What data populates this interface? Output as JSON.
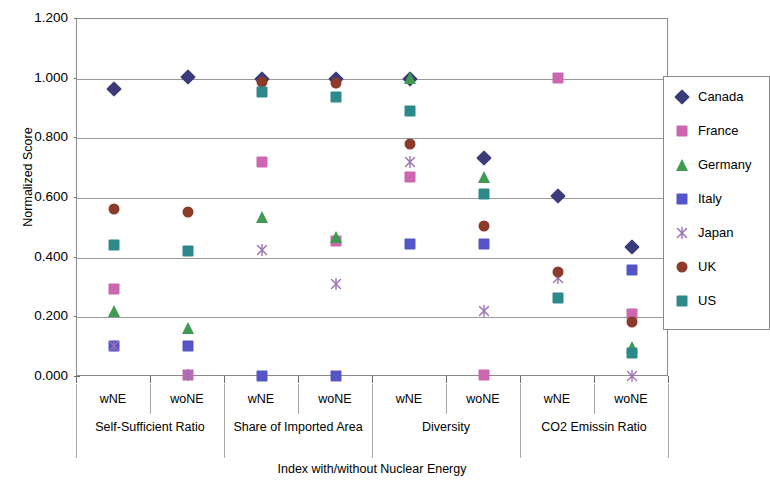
{
  "chart_data": {
    "type": "scatter",
    "title": "",
    "xlabel": "Index with/without Nuclear Energy",
    "ylabel": "Normalized Score",
    "ylim": [
      0.0,
      1.2
    ],
    "yticks": [
      "0.000",
      "0.200",
      "0.400",
      "0.600",
      "0.800",
      "1.000",
      "1.200"
    ],
    "ytick_values": [
      0.0,
      0.2,
      0.4,
      0.6,
      0.8,
      1.0,
      1.2
    ],
    "grid": "horizontal",
    "legend_position": "right",
    "x_groups": [
      {
        "label": "Self-Sufficient Ratio",
        "subs": [
          "wNE",
          "woNE"
        ]
      },
      {
        "label": "Share of Imported Area",
        "subs": [
          "wNE",
          "woNE"
        ]
      },
      {
        "label": "Diversity",
        "subs": [
          "wNE",
          "woNE"
        ]
      },
      {
        "label": "CO2 Emissin Ratio",
        "subs": [
          "wNE",
          "woNE"
        ]
      }
    ],
    "categories": [
      "Self-Sufficient Ratio wNE",
      "Self-Sufficient Ratio woNE",
      "Share of Imported Area wNE",
      "Share of Imported Area woNE",
      "Diversity wNE",
      "Diversity woNE",
      "CO2 Emissin Ratio wNE",
      "CO2 Emissin Ratio woNE"
    ],
    "series": [
      {
        "name": "Canada",
        "color": "#3b3b7a",
        "marker": "diamond",
        "values": [
          0.965,
          1.005,
          1.0,
          1.0,
          1.0,
          0.733,
          0.608,
          0.435
        ]
      },
      {
        "name": "France",
        "color": "#cc66b0",
        "marker": "square",
        "values": [
          0.295,
          0.008,
          0.722,
          0.455,
          0.672,
          0.008,
          1.003,
          0.21
        ]
      },
      {
        "name": "Germany",
        "color": "#3f9a52",
        "marker": "triangle",
        "values": [
          0.222,
          0.163,
          0.535,
          0.47,
          1.003,
          0.672,
          null,
          0.1
        ]
      },
      {
        "name": "Italy",
        "color": "#5555c8",
        "marker": "square",
        "values": [
          0.105,
          0.105,
          0.005,
          0.005,
          0.447,
          0.447,
          null,
          0.357
        ]
      },
      {
        "name": "Japan",
        "color": "#9b6fb5",
        "marker": "star",
        "values": [
          0.105,
          0.008,
          0.425,
          0.312,
          0.722,
          0.222,
          0.332,
          0.005
        ]
      },
      {
        "name": "UK",
        "color": "#8c3a2a",
        "marker": "circle",
        "values": [
          0.563,
          0.553,
          0.99,
          0.985,
          0.782,
          0.505,
          0.352,
          0.185
        ]
      },
      {
        "name": "US",
        "color": "#2e8a8a",
        "marker": "square",
        "values": [
          0.443,
          0.423,
          0.955,
          0.94,
          0.89,
          0.612,
          0.265,
          0.08
        ]
      }
    ]
  }
}
